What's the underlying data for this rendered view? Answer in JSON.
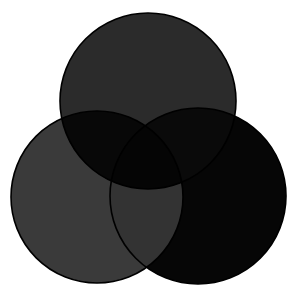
{
  "diagram": {
    "type": "venn",
    "background": "#ffffff",
    "stroke": "#000000",
    "circles": [
      {
        "name": "top",
        "cx": 148,
        "cy": 101,
        "r": 88,
        "fill": "#2b2b2b"
      },
      {
        "name": "left",
        "cx": 97,
        "cy": 197,
        "r": 86,
        "fill": "#3a3a3a"
      },
      {
        "name": "right",
        "cx": 198,
        "cy": 196,
        "r": 88,
        "fill": "#060606"
      }
    ],
    "overlaps": {
      "top_left": "#080808",
      "top_right": "#0a0a0a",
      "left_right": "#333333",
      "all": "#050505"
    }
  }
}
